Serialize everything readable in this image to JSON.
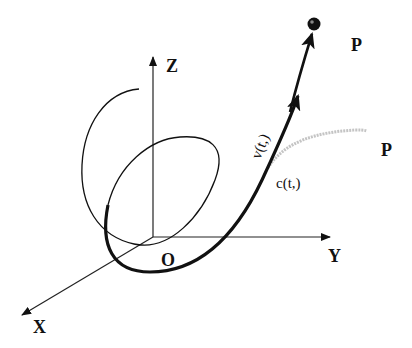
{
  "figure": {
    "axes": {
      "x_label": "X",
      "y_label": "Y",
      "z_label": "Z",
      "origin_label": "O"
    },
    "curve_label": "c(t,)",
    "velocity_label": "v(t,)",
    "point_label_upper": "P",
    "point_label_lower": "P",
    "colors": {
      "ink": "#111111",
      "faded_curve": "#bdbdbd",
      "background": "#ffffff"
    }
  }
}
